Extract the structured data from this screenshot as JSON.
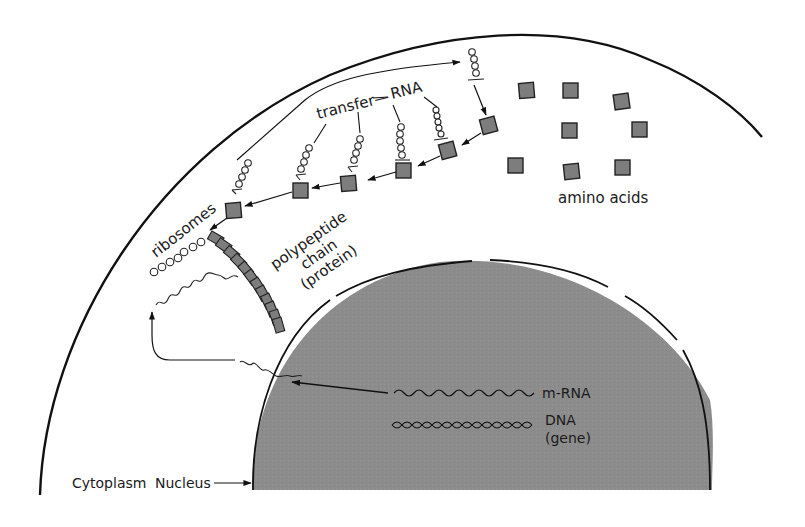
{
  "diagram": {
    "colors": {
      "background": "#ffffff",
      "nucleus_fill": "#8a8a8a",
      "amino_acid_fill": "#7d7d7d",
      "stroke": "#111111"
    },
    "labels": {
      "transfer_rna_prefix": "transfer",
      "transfer_rna_suffix": "RNA",
      "amino_acids": "amino acids",
      "ribosomes": "ribosomes",
      "polypeptide_line1": "polypeptide",
      "polypeptide_line2": "chain",
      "polypeptide_line3": "(protein)",
      "mrna": "m-RNA",
      "dna_line1": "DNA",
      "dna_line2": "(gene)",
      "cytoplasm": "Cytoplasm",
      "nucleus": "Nucleus"
    },
    "regions": [
      "Cytoplasm",
      "Nucleus"
    ],
    "counts": {
      "free_amino_acids": 9,
      "trna_molecules": 6,
      "ribosome_circles": 8,
      "polypeptide_segments": 14
    }
  }
}
